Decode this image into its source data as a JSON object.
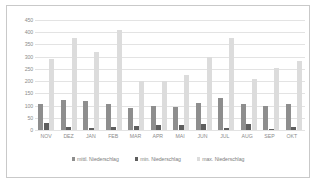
{
  "chart_data": {
    "type": "bar",
    "title": "",
    "xlabel": "",
    "ylabel": "",
    "ylim": [
      0,
      450
    ],
    "yticks": [
      0,
      50,
      100,
      150,
      200,
      250,
      300,
      350,
      400,
      450
    ],
    "ytick_labels": [
      "0",
      "50",
      "100",
      "150",
      "200",
      "250",
      "300",
      "350",
      "400",
      "450"
    ],
    "grid": true,
    "legend_position": "bottom",
    "categories": [
      "NOV",
      "DEZ",
      "JAN",
      "FEB",
      "MAR",
      "APR",
      "MAI",
      "JUN",
      "JUL",
      "AUG",
      "SEP",
      "OKT"
    ],
    "series": [
      {
        "name": "mittl. Niederschlag",
        "color": "#8e8e8e",
        "values": [
          107,
          122,
          120,
          108,
          90,
          100,
          95,
          111,
          132,
          108,
          97,
          107
        ]
      },
      {
        "name": "min. Niederschlag",
        "color": "#5e5e5e",
        "values": [
          27,
          12,
          10,
          11,
          17,
          19,
          21,
          24,
          10,
          23,
          2,
          14
        ]
      },
      {
        "name": "max. Niederschlag",
        "color": "#dcdcdc",
        "values": [
          290,
          378,
          320,
          408,
          200,
          202,
          225,
          298,
          378,
          207,
          255,
          283
        ]
      }
    ]
  },
  "legend": {
    "items": [
      {
        "label": "mittl. Niederschlag",
        "color": "#8e8e8e"
      },
      {
        "label": "min. Niederschlag",
        "color": "#5e5e5e"
      },
      {
        "label": "max. Niederschlag",
        "color": "#dcdcdc"
      }
    ]
  }
}
